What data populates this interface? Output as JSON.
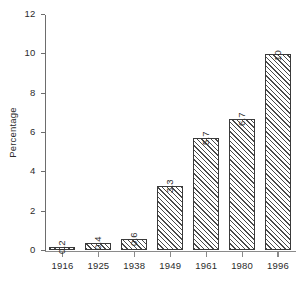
{
  "chart_data": {
    "type": "bar",
    "title": "",
    "xlabel": "",
    "ylabel": "Percentage",
    "categories": [
      "1916",
      "1925",
      "1938",
      "1949",
      "1961",
      "1980",
      "1996"
    ],
    "values": [
      0.2,
      0.4,
      0.6,
      3.3,
      5.7,
      6.7,
      10
    ],
    "value_labels": [
      "0.2",
      "0.4",
      "0.6",
      "3.3",
      "5.7",
      "6.7",
      "10"
    ],
    "ylim": [
      0,
      12
    ],
    "ytick_labels": [
      "0",
      "2",
      "4",
      "6",
      "8",
      "10",
      "12"
    ],
    "ytick_values": [
      0,
      2,
      4,
      6,
      8,
      10,
      12
    ],
    "grid": false,
    "legend": null,
    "bar_style": {
      "fill": "#ffffff",
      "hatch": "diagonal-forward",
      "hatch_color": "#4a4a4a",
      "edge_color": "#3a3a3a"
    },
    "axis_color": "#8a8a8a",
    "text_color": "#2b2b2b",
    "background": "#ffffff"
  }
}
